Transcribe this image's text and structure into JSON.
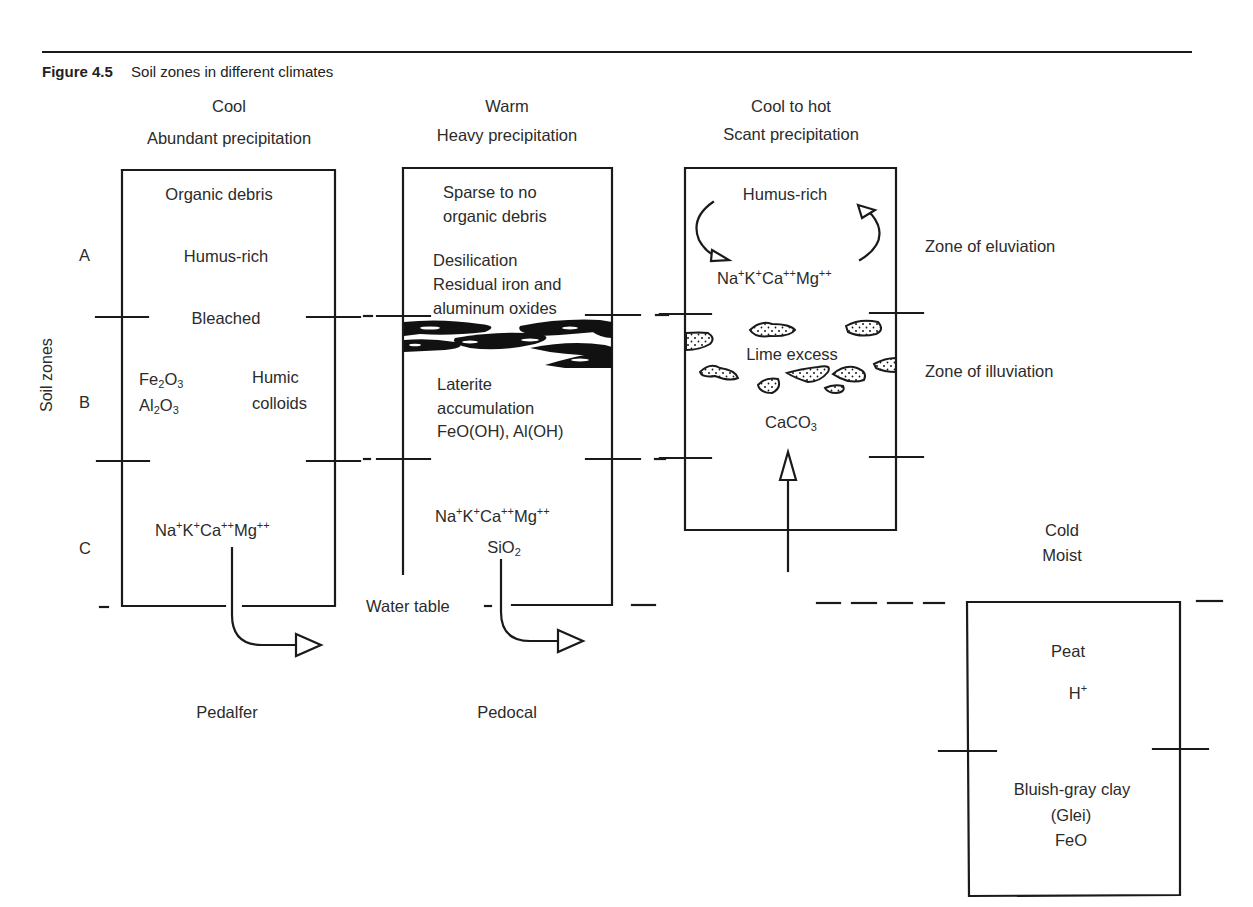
{
  "figure": {
    "number": "Figure 4.5",
    "title": "Soil zones in different climates"
  },
  "axis": {
    "label": "Soil zones",
    "zones": [
      "A",
      "B",
      "C"
    ]
  },
  "columns": [
    {
      "climate_line1": "Cool",
      "climate_line2": "Abundant precipitation",
      "labels": {
        "organic": "Organic debris",
        "humus": "Humus-rich",
        "bleached": "Bleached",
        "fe2o3_base": "Fe",
        "fe2o3_sub1": "2",
        "fe2o3_mid": "O",
        "fe2o3_sub2": "3",
        "al2o3_base": "Al",
        "al2o3_sub1": "2",
        "al2o3_mid": "O",
        "al2o3_sub2": "3",
        "humic1": "Humic",
        "humic2": "colloids",
        "ions": {
          "na": "Na",
          "p1": "+",
          "k": "K",
          "p2": "+",
          "ca": "Ca",
          "p3": "++",
          "mg": "Mg",
          "p4": "++"
        }
      },
      "soil_type": "Pedalfer"
    },
    {
      "climate_line1": "Warm",
      "climate_line2": "Heavy precipitation",
      "labels": {
        "sparse1": "Sparse to no",
        "sparse2": "organic debris",
        "desil": "Desilication",
        "residual1": "Residual iron and",
        "residual2": "aluminum oxides",
        "laterite1": "Laterite",
        "laterite2": "accumulation",
        "laterite3": "FeO(OH), Al(OH)",
        "ions": {
          "na": "Na",
          "p1": "+",
          "k": "K",
          "p2": "+",
          "ca": "Ca",
          "p3": "++",
          "mg": "Mg",
          "p4": "++"
        },
        "sio2_base": "SiO",
        "sio2_sub": "2"
      },
      "soil_type": "Pedocal",
      "water_table": "Water table"
    },
    {
      "climate_line1": "Cool to hot",
      "climate_line2": "Scant precipitation",
      "labels": {
        "humus": "Humus-rich",
        "ions": {
          "na": "Na",
          "p1": "+",
          "k": "K",
          "p2": "+",
          "ca": "Ca",
          "p3": "++",
          "mg": "Mg",
          "p4": "++"
        },
        "lime": "Lime excess",
        "caco3_base": "CaCO",
        "caco3_sub": "3"
      }
    },
    {
      "climate_line1": "Cold",
      "climate_line2": "Moist",
      "labels": {
        "peat": "Peat",
        "h_base": "H",
        "h_sup": "+",
        "clay1": "Bluish-gray clay",
        "clay2": "(Glei)",
        "clay3": "FeO"
      }
    }
  ],
  "zone_annotations": {
    "eluviation": "Zone of eluviation",
    "illuviation": "Zone of illuviation"
  },
  "colors": {
    "line": "#1a1a1a",
    "text": "#2b2b2b",
    "background": "#ffffff"
  }
}
